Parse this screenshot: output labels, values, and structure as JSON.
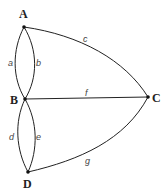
{
  "diagram": {
    "type": "graph",
    "nodes": [
      {
        "id": "A",
        "label": "A"
      },
      {
        "id": "B",
        "label": "B"
      },
      {
        "id": "C",
        "label": "C"
      },
      {
        "id": "D",
        "label": "D"
      }
    ],
    "edges": [
      {
        "id": "a",
        "label": "a",
        "from": "A",
        "to": "B"
      },
      {
        "id": "b",
        "label": "b",
        "from": "A",
        "to": "B"
      },
      {
        "id": "c",
        "label": "c",
        "from": "A",
        "to": "C"
      },
      {
        "id": "f",
        "label": "f",
        "from": "B",
        "to": "C"
      },
      {
        "id": "d",
        "label": "d",
        "from": "B",
        "to": "D"
      },
      {
        "id": "e",
        "label": "e",
        "from": "B",
        "to": "D"
      },
      {
        "id": "g",
        "label": "g",
        "from": "D",
        "to": "C"
      }
    ]
  }
}
